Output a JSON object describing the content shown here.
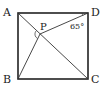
{
  "diagram": {
    "type": "geometry",
    "shape": "square",
    "points": {
      "A": {
        "label": "A",
        "x": 18,
        "y": 13
      },
      "B": {
        "label": "B",
        "x": 18,
        "y": 79
      },
      "C": {
        "label": "C",
        "x": 88,
        "y": 79
      },
      "D": {
        "label": "D",
        "x": 88,
        "y": 13
      },
      "P": {
        "label": "P",
        "x": 40,
        "y": 34
      }
    },
    "segments": [
      "AB",
      "BC",
      "CD",
      "DA",
      "AC",
      "PB",
      "PD"
    ],
    "angle_annotation": {
      "vertex": "D",
      "value": "65°"
    },
    "angle_mark_at_P": "arc between PA and PB",
    "colors": {
      "stroke": "#333333",
      "square_stroke": "#222222"
    }
  }
}
